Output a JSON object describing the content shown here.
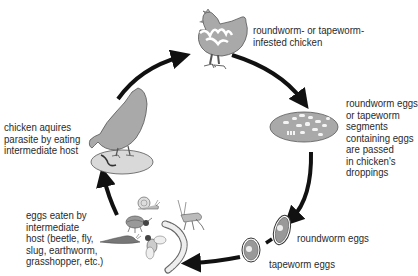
{
  "colors": {
    "fill_gray": "#a9a9a9",
    "light_gray": "#d9d9d9",
    "arrow": "#111111",
    "outline": "#555555",
    "text": "#2a2a2a"
  },
  "stages": [
    {
      "id": "infested-chicken",
      "label": "roundworm- or tapeworm-\ninfested chicken"
    },
    {
      "id": "droppings",
      "label": "roundworm eggs\nor tapeworm\nsegments\ncontaining eggs\nare passed\nin chicken's\ndroppings"
    },
    {
      "id": "roundworm-eggs",
      "label": "roundworm eggs"
    },
    {
      "id": "tapeworm-eggs",
      "label": "tapeworm eggs"
    },
    {
      "id": "intermediate-hosts",
      "label": "eggs eaten by\nintermediate\nhost (beetle, fly,\nslug, earthworm,\ngrasshopper, etc.)"
    },
    {
      "id": "chicken-eating",
      "label": "chicken aquires\nparasite by eating\nintermediate host"
    }
  ],
  "intermediate_hosts": [
    "snail",
    "beetle",
    "slug",
    "fly",
    "grasshopper",
    "earthworm"
  ],
  "arrows": [
    {
      "from": "chicken-eating",
      "to": "infested-chicken"
    },
    {
      "from": "infested-chicken",
      "to": "droppings"
    },
    {
      "from": "droppings",
      "to": "roundworm-eggs"
    },
    {
      "from": "tapeworm-eggs",
      "to": "intermediate-hosts"
    },
    {
      "from": "intermediate-hosts",
      "to": "chicken-eating"
    }
  ]
}
